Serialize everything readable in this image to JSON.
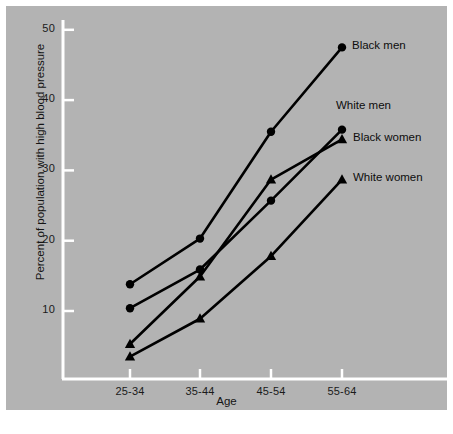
{
  "chart_data": {
    "type": "line",
    "title": "",
    "xlabel": "Age",
    "ylabel": "Percent of population with high blood pressure",
    "categories": [
      "25-34",
      "35-44",
      "45-54",
      "55-64"
    ],
    "xtick_labels": [
      "25-34",
      "35-44",
      "45-54",
      "55-64"
    ],
    "ytick_labels": [
      "10",
      "20",
      "30",
      "40",
      "50"
    ],
    "ytick_values": [
      10,
      20,
      30,
      40,
      50
    ],
    "ylim": [
      0,
      53
    ],
    "grid": false,
    "legend_position": "inline-right-of-last-point",
    "background_color": "#b3b3b3",
    "axis_color": "#ffffff",
    "line_color": "#000000",
    "series": [
      {
        "name": "Black men",
        "label": "Black men",
        "marker": "circle",
        "values": [
          13.8,
          20.3,
          35.5,
          47.5
        ]
      },
      {
        "name": "White men",
        "label": "White men",
        "marker": "circle",
        "values": [
          10.4,
          15.9,
          25.7,
          35.8
        ]
      },
      {
        "name": "Black women",
        "label": "Black women",
        "marker": "triangle",
        "values": [
          5.3,
          14.9,
          28.7,
          34.4
        ]
      },
      {
        "name": "White women",
        "label": "White women",
        "marker": "triangle",
        "values": [
          3.5,
          8.9,
          17.8,
          28.7
        ]
      }
    ]
  },
  "annotations": {
    "black_men": "Black men",
    "white_men": "White men",
    "black_women": "Black women",
    "white_women": "White women"
  }
}
